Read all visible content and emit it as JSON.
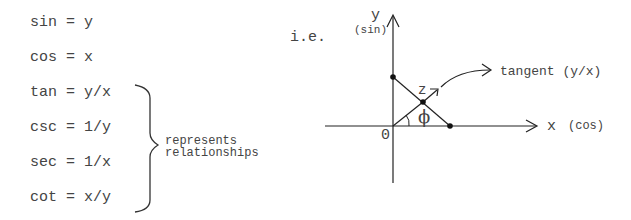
{
  "equations": [
    {
      "fn": "sin",
      "expr": "y",
      "text": "sin = y"
    },
    {
      "fn": "cos",
      "expr": "x",
      "text": "cos = x"
    },
    {
      "fn": "tan",
      "expr": "y/x",
      "text": "tan = y/x"
    },
    {
      "fn": "csc",
      "expr": "1/y",
      "text": "csc = 1/y"
    },
    {
      "fn": "sec",
      "expr": "1/x",
      "text": "sec = 1/x"
    },
    {
      "fn": "cot",
      "expr": "x/y",
      "text": "cot = x/y"
    }
  ],
  "bracket_note": {
    "line1": "represents",
    "line2": "relationships"
  },
  "ie_label": "i.e.",
  "diagram": {
    "y_axis_label": "y",
    "y_axis_sub": "(sin)",
    "x_axis_label": "x",
    "x_axis_sub": "(cos)",
    "origin_label": "0",
    "point_label": "z",
    "angle_label": "ϕ",
    "tangent_label": "tangent (y/x)"
  },
  "colors": {
    "ink": "#444444",
    "line": "#222222"
  }
}
